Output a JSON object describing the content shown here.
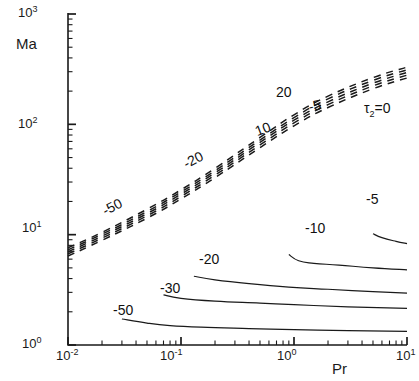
{
  "figure": {
    "width": 419,
    "height": 381,
    "background": "#ffffff",
    "line_color": "#1a1a1a",
    "axis_color": "#1a1a1a"
  },
  "axes": {
    "x_title": "Pr",
    "y_title": "Ma",
    "x_ticklabels": [
      "10-2",
      "10-1",
      "100",
      "101"
    ],
    "x_tick_mantissa": [
      "10",
      "10",
      "10",
      "10"
    ],
    "x_tick_exponents": [
      "-2",
      "-1",
      "0",
      "1"
    ],
    "y_tick_mantissa": [
      "10",
      "10",
      "10",
      "10"
    ],
    "y_tick_exponents": [
      "0",
      "1",
      "2",
      "3"
    ]
  },
  "labels": {
    "dashed": [
      {
        "text": "-50",
        "x": 100,
        "y": 205,
        "rot": -27
      },
      {
        "text": "-20",
        "x": 181,
        "y": 158,
        "rot": -27
      },
      {
        "text": "10",
        "x": 253,
        "y": 125,
        "rot": -21
      },
      {
        "text": "20",
        "x": 276,
        "y": 85,
        "rot": 0
      },
      {
        "text": "-5",
        "x": 307,
        "y": 100,
        "rot": -13
      }
    ],
    "tau_main": "τ",
    "tau_sub": "2",
    "tau_eq": "=0",
    "tau_x": 364,
    "tau_y": 101,
    "solid": [
      {
        "text": "-5",
        "x": 366,
        "y": 192
      },
      {
        "text": "-10",
        "x": 305,
        "y": 221
      },
      {
        "text": "-20",
        "x": 199,
        "y": 252
      },
      {
        "text": "-30",
        "x": 160,
        "y": 281
      },
      {
        "text": "-50",
        "x": 113,
        "y": 303
      }
    ]
  },
  "chart_data": {
    "type": "line",
    "title": "",
    "xlabel": "Pr",
    "ylabel": "Ma",
    "xscale": "log",
    "yscale": "log",
    "xlim": [
      0.01,
      10
    ],
    "ylim": [
      1,
      1000
    ],
    "grid": false,
    "legend": "none",
    "annotations": [
      "τ₂=0",
      "20",
      "10",
      "-5",
      "-20",
      "-50",
      "-5",
      "-10",
      "-20",
      "-30",
      "-50"
    ],
    "series": [
      {
        "name": "tau2 = 0 (dashed, neutral stability)",
        "style": "dashed",
        "label": "τ₂=0",
        "x": [
          0.01,
          0.02,
          0.05,
          0.1,
          0.2,
          0.5,
          1.0,
          2.0,
          5.0,
          10.0
        ],
        "y": [
          7.6,
          10.5,
          17.0,
          25.5,
          40.0,
          76.0,
          122.0,
          180.0,
          265.0,
          330.0
        ]
      },
      {
        "name": "tau2 = -5 (dashed)",
        "style": "dashed",
        "label": "-5",
        "x": [
          0.01,
          0.02,
          0.05,
          0.1,
          0.2,
          0.5,
          1.0,
          2.0,
          5.0,
          10.0
        ],
        "y": [
          7.3,
          10.1,
          16.2,
          24.4,
          38.0,
          72.0,
          115.0,
          170.0,
          250.0,
          312.0
        ]
      },
      {
        "name": "tau2 = 5 (dashed)",
        "style": "dashed",
        "label": "5",
        "x": [
          0.01,
          0.02,
          0.05,
          0.1,
          0.2,
          0.5,
          1.0,
          2.0,
          5.0,
          10.0
        ],
        "y": [
          7.0,
          9.7,
          15.5,
          23.3,
          36.3,
          68.5,
          109.0,
          160.0,
          236.0,
          295.0
        ]
      },
      {
        "name": "tau2 = 10 (dashed)",
        "style": "dashed",
        "label": "10",
        "x": [
          0.01,
          0.02,
          0.05,
          0.1,
          0.2,
          0.5,
          1.0,
          2.0,
          5.0,
          10.0
        ],
        "y": [
          6.7,
          9.3,
          14.8,
          22.2,
          34.6,
          65.0,
          103.0,
          151.0,
          223.0,
          279.0
        ]
      },
      {
        "name": "tau2 = 20 (dashed)",
        "style": "dashed",
        "label": "20",
        "x": [
          0.01,
          0.02,
          0.05,
          0.1,
          0.2,
          0.5,
          1.0,
          2.0,
          5.0,
          10.0
        ],
        "y": [
          6.4,
          8.9,
          14.1,
          21.1,
          32.9,
          61.5,
          97.0,
          142.0,
          210.0,
          263.0
        ]
      },
      {
        "name": "tau2 = -5 (solid)",
        "style": "solid",
        "label": "-5",
        "x": [
          5.0,
          6.0,
          8.0,
          10.0
        ],
        "y": [
          10.2,
          9.4,
          8.7,
          8.3
        ]
      },
      {
        "name": "tau2 = -10 (solid)",
        "style": "solid",
        "label": "-10",
        "x": [
          0.9,
          1.1,
          1.5,
          2.5,
          5.0,
          10.0
        ],
        "y": [
          6.6,
          5.8,
          5.5,
          5.3,
          5.0,
          4.8
        ]
      },
      {
        "name": "tau2 = -20 (solid)",
        "style": "solid",
        "label": "-20",
        "x": [
          0.13,
          0.2,
          0.4,
          0.9,
          2.0,
          5.0,
          10.0
        ],
        "y": [
          4.2,
          3.9,
          3.6,
          3.35,
          3.2,
          3.05,
          2.95
        ]
      },
      {
        "name": "tau2 = -30 (solid)",
        "style": "solid",
        "label": "-30",
        "x": [
          0.07,
          0.1,
          0.2,
          0.5,
          1.0,
          3.0,
          10.0
        ],
        "y": [
          2.85,
          2.65,
          2.5,
          2.4,
          2.32,
          2.22,
          2.15
        ]
      },
      {
        "name": "tau2 = -50 (solid)",
        "style": "solid",
        "label": "-50",
        "x": [
          0.03,
          0.05,
          0.08,
          0.15,
          0.4,
          1.0,
          3.0,
          10.0
        ],
        "y": [
          1.72,
          1.58,
          1.5,
          1.45,
          1.41,
          1.38,
          1.35,
          1.33
        ]
      }
    ]
  }
}
